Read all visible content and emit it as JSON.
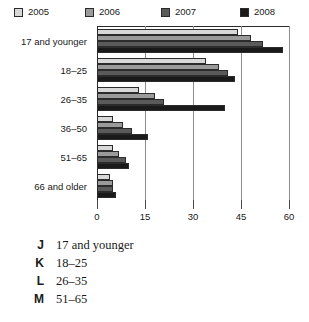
{
  "chart_data": {
    "type": "bar",
    "orientation": "horizontal",
    "title": "",
    "xlabel": "",
    "ylabel": "",
    "xlim": [
      0,
      60
    ],
    "xticks": [
      0,
      15,
      30,
      45,
      60
    ],
    "xticklabels": [
      "0",
      "15",
      "30",
      "45",
      "60"
    ],
    "grid": true,
    "legend_position": "top",
    "categories": [
      "17 and younger",
      "18–25",
      "26–35",
      "36–50",
      "51–65",
      "66 and older"
    ],
    "series": [
      {
        "name": "2005",
        "color": "#d8d8d8",
        "values": [
          44,
          34,
          13,
          5,
          5,
          4
        ]
      },
      {
        "name": "2006",
        "color": "#9a9a9a",
        "values": [
          48,
          38,
          18,
          8,
          7,
          5
        ]
      },
      {
        "name": "2007",
        "color": "#5a5a5a",
        "values": [
          52,
          41,
          21,
          11,
          9,
          5
        ]
      },
      {
        "name": "2008",
        "color": "#1a1a1a",
        "values": [
          58,
          43,
          40,
          16,
          10,
          6
        ]
      }
    ]
  },
  "legend": {
    "items": [
      {
        "label": "2005",
        "color": "#d8d8d8"
      },
      {
        "label": "2006",
        "color": "#9a9a9a"
      },
      {
        "label": "2007",
        "color": "#5a5a5a"
      },
      {
        "label": "2008",
        "color": "#1a1a1a"
      }
    ]
  },
  "choices": [
    {
      "letter": "J",
      "text": "17 and younger"
    },
    {
      "letter": "K",
      "text": "18–25"
    },
    {
      "letter": "L",
      "text": "26–35"
    },
    {
      "letter": "M",
      "text": "51–65"
    }
  ]
}
